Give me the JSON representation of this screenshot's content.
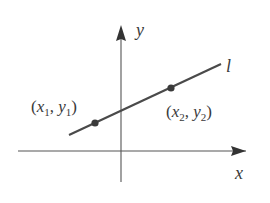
{
  "diagram": {
    "type": "coordinate-plane-line",
    "axes": {
      "x_label": "x",
      "y_label": "y",
      "color": "#333333"
    },
    "line": {
      "label": "l",
      "color": "#4a4a4a"
    },
    "points": [
      {
        "name": "point-1",
        "x_sym": "x",
        "x_sub": "1",
        "y_sym": "y",
        "y_sub": "1",
        "open": "(",
        "sep": ", ",
        "close": ")"
      },
      {
        "name": "point-2",
        "x_sym": "x",
        "x_sub": "2",
        "y_sym": "y",
        "y_sub": "2",
        "open": "(",
        "sep": ", ",
        "close": ")"
      }
    ]
  }
}
